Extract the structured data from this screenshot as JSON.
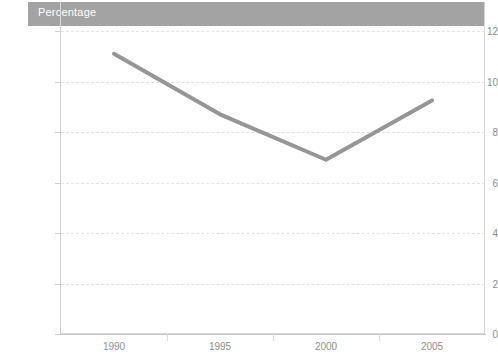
{
  "title": {
    "text": "Percentage",
    "bar_color": "#a3a3a3",
    "text_color": "#ffffff"
  },
  "chart_data": {
    "type": "line",
    "title": "Percentage",
    "xlabel": "",
    "ylabel": "",
    "categories": [
      "1990",
      "1995",
      "2000",
      "2005"
    ],
    "x": [
      1990,
      1995,
      2000,
      2005
    ],
    "series": [
      {
        "name": "Percentage",
        "values": [
          11.1,
          8.7,
          6.9,
          9.25
        ],
        "color": "#969696",
        "line_width": 4
      }
    ],
    "ylim": [
      0,
      12
    ],
    "y_ticks": [
      0,
      2,
      4,
      6,
      8,
      10,
      12
    ],
    "y_tick_labels": [
      "0",
      "2",
      "4",
      "6",
      "8",
      "10",
      "12"
    ],
    "x_tick_labels": [
      "1990",
      "1995",
      "2000",
      "2005"
    ],
    "grid": true,
    "grid_axis": "y",
    "grid_style": "dashed",
    "grid_color": "#e2e2e2",
    "legend": false,
    "legend_position": "none",
    "markers": false,
    "background": "#ffffff",
    "plot_border_color": "#d8d8d8"
  },
  "axes": {
    "y_ticks": [
      {
        "value": 12,
        "label": "12"
      },
      {
        "value": 10,
        "label": "10"
      },
      {
        "value": 8,
        "label": "8"
      },
      {
        "value": 6,
        "label": "6"
      },
      {
        "value": 4,
        "label": "4"
      },
      {
        "value": 2,
        "label": "2"
      },
      {
        "value": 0,
        "label": "0"
      }
    ],
    "x_ticks": [
      {
        "value": 1990,
        "label": "1990"
      },
      {
        "value": 1995,
        "label": "1995"
      },
      {
        "value": 2000,
        "label": "2000"
      },
      {
        "value": 2005,
        "label": "2005"
      }
    ]
  }
}
